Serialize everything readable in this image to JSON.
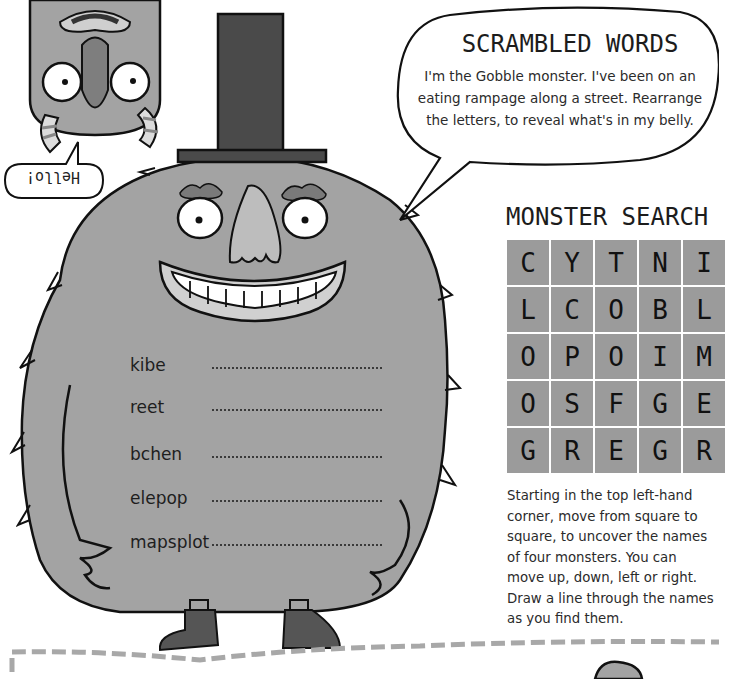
{
  "scrambled_words": {
    "title": "SCRAMBLED WORDS",
    "intro": "I'm the Gobble monster. I've been on an eating rampage along a street. Rearrange the letters, to reveal what's in my belly.",
    "words": [
      {
        "scrambled": "kibe",
        "answer": ""
      },
      {
        "scrambled": "reet",
        "answer": ""
      },
      {
        "scrambled": "bchen",
        "answer": ""
      },
      {
        "scrambled": "elepop",
        "answer": ""
      },
      {
        "scrambled": "mapsplot",
        "answer": ""
      }
    ]
  },
  "hello_bubble": {
    "text": "Hello!"
  },
  "monster_search": {
    "title": "MONSTER SEARCH",
    "grid": [
      [
        "C",
        "Y",
        "T",
        "N",
        "I"
      ],
      [
        "L",
        "C",
        "O",
        "B",
        "L"
      ],
      [
        "O",
        "P",
        "O",
        "I",
        "M"
      ],
      [
        "O",
        "S",
        "F",
        "G",
        "E"
      ],
      [
        "G",
        "R",
        "E",
        "G",
        "R"
      ]
    ],
    "instructions": "Starting in the top left-hand corner, move from square to square, to uncover the names of four monsters. You can move up, down, left or right. Draw a line through the names as you find them."
  },
  "illustrations": [
    {
      "name": "gobble-monster",
      "description": "Furry grey monster with top hat, big grin, boots"
    },
    {
      "name": "upside-down-monster",
      "description": "Upside-down grey monster with striped horns"
    }
  ],
  "colors": {
    "fur": "#a3a3a3",
    "hat": "#4a4a4a",
    "cell": "#9b9b9b",
    "outline": "#111111",
    "dash": "#a8a8a8"
  }
}
